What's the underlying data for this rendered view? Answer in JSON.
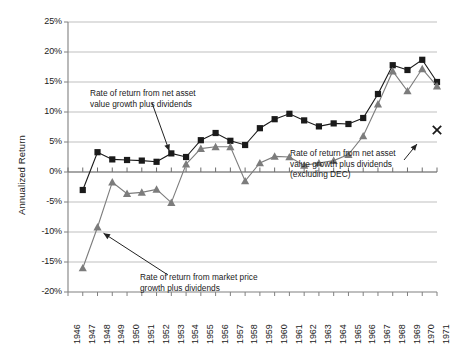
{
  "chart_data": {
    "type": "line",
    "title": "",
    "xlabel": "",
    "ylabel": "Annualized Return",
    "ylim": [
      -20,
      25
    ],
    "ytick_labels": [
      "25%",
      "20%",
      "15%",
      "10%",
      "5%",
      "0%",
      "-5%",
      "-10%",
      "-15%",
      "-20%"
    ],
    "ytick_values": [
      25,
      20,
      15,
      10,
      5,
      0,
      -5,
      -10,
      -15,
      -20
    ],
    "grid": "horizontal",
    "legend_position": "none",
    "categories": [
      "1946",
      "1947",
      "1948",
      "1949",
      "1950",
      "1951",
      "1952",
      "1953",
      "1954",
      "1955",
      "1956",
      "1957",
      "1958",
      "1959",
      "1960",
      "1961",
      "1962",
      "1963",
      "1964",
      "1965",
      "1966",
      "1967",
      "1968",
      "1969",
      "1970",
      "1971"
    ],
    "series": [
      {
        "name": "Rate of return from net asset value growth plus dividends",
        "marker": "square",
        "color": "#1a1a1a",
        "x": [
          "1947",
          "1948",
          "1949",
          "1950",
          "1951",
          "1952",
          "1953",
          "1954",
          "1955",
          "1956",
          "1957",
          "1958",
          "1959",
          "1960",
          "1961",
          "1962",
          "1963",
          "1964",
          "1965",
          "1966",
          "1967",
          "1968",
          "1969",
          "1970",
          "1971"
        ],
        "values": [
          -3.0,
          3.3,
          2.1,
          2.0,
          1.9,
          1.7,
          3.1,
          2.5,
          5.3,
          6.5,
          5.2,
          4.5,
          7.3,
          8.8,
          9.7,
          8.6,
          7.6,
          8.1,
          8.0,
          9.0,
          13.0,
          17.8,
          17.0,
          18.7,
          15.0
        ]
      },
      {
        "name": "Rate of return from market price growth plus dividends",
        "marker": "triangle",
        "color": "#7c7c7c",
        "x": [
          "1947",
          "1948",
          "1949",
          "1950",
          "1951",
          "1952",
          "1953",
          "1954",
          "1955",
          "1956",
          "1957",
          "1958",
          "1959",
          "1960",
          "1961",
          "1962",
          "1963",
          "1964",
          "1965",
          "1966",
          "1967",
          "1968",
          "1969",
          "1970",
          "1971"
        ],
        "values": [
          -16.0,
          -9.2,
          -1.7,
          -3.6,
          -3.4,
          -2.9,
          -5.1,
          1.3,
          3.9,
          4.2,
          4.2,
          -1.5,
          1.5,
          2.6,
          2.5,
          1.1,
          1.5,
          1.9,
          2.9,
          6.0,
          11.3,
          16.8,
          13.5,
          17.2,
          14.3
        ]
      },
      {
        "name": "Rate of return from net asset value growth plus dividends (excluding DEC)",
        "marker": "x",
        "color": "#1a1a1a",
        "x": [
          "1971"
        ],
        "values": [
          7.0
        ]
      }
    ],
    "annotations": [
      {
        "id": "anno-nav",
        "text": "Rate of return from net asset\nvalue growth plus dividends",
        "arrow_to_x": "1953",
        "arrow_to_y": 2.5
      },
      {
        "id": "anno-nav-ex-dec",
        "text": "Rate of return from net asset\nvalue growth plus dividends\n(excluding DEC)",
        "arrow_to_x": "1971",
        "arrow_to_y": 7.0
      },
      {
        "id": "anno-market",
        "text": "Rate of return from market price\ngrowth plus dividends",
        "arrow_to_x": "1948",
        "arrow_to_y": -9.2
      }
    ],
    "colors": {
      "series_nav": "#1a1a1a",
      "series_market": "#7c7c7c",
      "gridline": "#bfbfbf",
      "axis": "#808080",
      "background": "#ffffff"
    }
  }
}
